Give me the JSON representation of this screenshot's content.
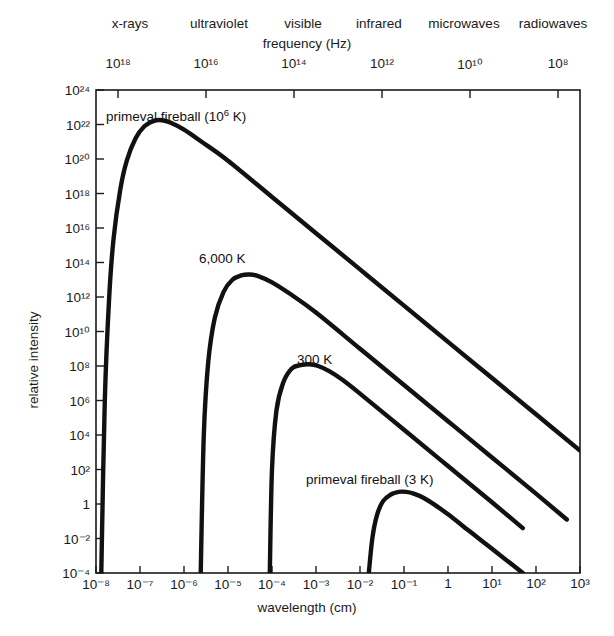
{
  "figure": {
    "frequency_axis_title": "frequency (Hz)",
    "wavelength_axis_title": "wavelength (cm)",
    "intensity_axis_title": "relative intensity"
  },
  "spectrum_bands": [
    {
      "label": "x-rays",
      "x": 130
    },
    {
      "label": "ultraviolet",
      "x": 219
    },
    {
      "label": "visible",
      "x": 303
    },
    {
      "label": "infrared",
      "x": 379
    },
    {
      "label": "microwaves",
      "x": 464
    },
    {
      "label": "radiowaves",
      "x": 553
    }
  ],
  "chart_data": {
    "type": "line",
    "title": "",
    "xlabel": "wavelength (cm)",
    "ylabel": "relative intensity",
    "top_xlabel": "frequency (Hz)",
    "x_scale": "log",
    "y_scale": "log",
    "xlim": [
      -8,
      3
    ],
    "ylim": [
      -4,
      24
    ],
    "grid": false,
    "legend": "inline-annotations",
    "x_ticks": [
      {
        "exp": "-8",
        "label": "10⁻⁸"
      },
      {
        "exp": "-7",
        "label": "10⁻⁷"
      },
      {
        "exp": "-6",
        "label": "10⁻⁶"
      },
      {
        "exp": "-5",
        "label": "10⁻⁵"
      },
      {
        "exp": "-4",
        "label": "10⁻⁴"
      },
      {
        "exp": "-3",
        "label": "10⁻³"
      },
      {
        "exp": "-2",
        "label": "10⁻²"
      },
      {
        "exp": "-1",
        "label": "10⁻¹"
      },
      {
        "exp": "0",
        "label": "1"
      },
      {
        "exp": "1",
        "label": "10¹"
      },
      {
        "exp": "2",
        "label": "10²"
      },
      {
        "exp": "3",
        "label": "10³"
      }
    ],
    "y_ticks": [
      {
        "exp": "24",
        "label": "10²⁴"
      },
      {
        "exp": "22",
        "label": "10²²"
      },
      {
        "exp": "20",
        "label": "10²⁰"
      },
      {
        "exp": "18",
        "label": "10¹⁸"
      },
      {
        "exp": "16",
        "label": "10¹⁶"
      },
      {
        "exp": "14",
        "label": "10¹⁴"
      },
      {
        "exp": "12",
        "label": "10¹²"
      },
      {
        "exp": "10",
        "label": "10¹⁰"
      },
      {
        "exp": "8",
        "label": "10⁸"
      },
      {
        "exp": "6",
        "label": "10⁶"
      },
      {
        "exp": "4",
        "label": "10⁴"
      },
      {
        "exp": "2",
        "label": "10²"
      },
      {
        "exp": "0",
        "label": "1"
      },
      {
        "exp": "-2",
        "label": "10⁻²"
      },
      {
        "exp": "-4",
        "label": "10⁻⁴"
      }
    ],
    "top_ticks": [
      {
        "label": "10¹⁸",
        "x_exp": -7.5
      },
      {
        "label": "10¹⁶",
        "x_exp": -5.5
      },
      {
        "label": "10¹⁴",
        "x_exp": -3.5
      },
      {
        "label": "10¹²",
        "x_exp": -1.5
      },
      {
        "label": "10¹⁰",
        "x_exp": 0.5
      },
      {
        "label": "10⁸",
        "x_exp": 2.5
      }
    ],
    "series": [
      {
        "name": "primeval fireball (10⁶ K)",
        "temperature_K": 1000000,
        "peak_x_exp": -5.55,
        "peak_y_exp": 22.2,
        "label_html": "primeval fireball (10<sup>6</sup> K)",
        "label_x": 106,
        "label_y": 109,
        "points": [
          [
            -7.88,
            -4.0
          ],
          [
            -7.8,
            6.0
          ],
          [
            -7.7,
            12.0
          ],
          [
            -7.6,
            15.4
          ],
          [
            -7.45,
            18.2
          ],
          [
            -7.3,
            19.9
          ],
          [
            -7.1,
            21.2
          ],
          [
            -6.9,
            21.9
          ],
          [
            -6.7,
            22.2
          ],
          [
            -6.5,
            22.25
          ],
          [
            -6.3,
            22.1
          ],
          [
            -6.0,
            21.7
          ],
          [
            -5.6,
            21.0
          ],
          [
            -5.0,
            19.9
          ],
          [
            -4.0,
            17.8
          ],
          [
            -3.0,
            15.7
          ],
          [
            -2.0,
            13.6
          ],
          [
            -1.0,
            11.5
          ],
          [
            0.0,
            9.4
          ],
          [
            1.0,
            7.3
          ],
          [
            2.0,
            5.2
          ],
          [
            3.0,
            3.1
          ]
        ]
      },
      {
        "name": "6,000 K",
        "temperature_K": 6000,
        "peak_x_exp": -3.5,
        "peak_y_exp": 13.2,
        "label_html": "6,000 K",
        "label_x": 199,
        "label_y": 251,
        "points": [
          [
            -5.62,
            -4.0
          ],
          [
            -5.55,
            4.0
          ],
          [
            -5.45,
            8.2
          ],
          [
            -5.3,
            10.8
          ],
          [
            -5.1,
            12.3
          ],
          [
            -4.9,
            13.0
          ],
          [
            -4.7,
            13.25
          ],
          [
            -4.5,
            13.3
          ],
          [
            -4.3,
            13.2
          ],
          [
            -4.0,
            12.85
          ],
          [
            -3.6,
            12.2
          ],
          [
            -3.0,
            11.1
          ],
          [
            -2.0,
            9.0
          ],
          [
            -1.0,
            6.9
          ],
          [
            0.0,
            4.8
          ],
          [
            1.0,
            2.7
          ],
          [
            2.0,
            0.6
          ],
          [
            2.7,
            -0.9
          ]
        ]
      },
      {
        "name": "300 K",
        "temperature_K": 300,
        "peak_x_exp": -2.25,
        "peak_y_exp": 8.0,
        "label_html": "300 K",
        "label_x": 297,
        "label_y": 352,
        "points": [
          [
            -4.05,
            -4.0
          ],
          [
            -4.0,
            2.0
          ],
          [
            -3.9,
            5.4
          ],
          [
            -3.75,
            7.0
          ],
          [
            -3.55,
            7.85
          ],
          [
            -3.35,
            8.05
          ],
          [
            -3.15,
            8.1
          ],
          [
            -2.95,
            8.0
          ],
          [
            -2.7,
            7.7
          ],
          [
            -2.4,
            7.2
          ],
          [
            -2.0,
            6.4
          ],
          [
            -1.0,
            4.3
          ],
          [
            0.0,
            2.2
          ],
          [
            1.0,
            0.1
          ],
          [
            1.7,
            -1.4
          ]
        ]
      },
      {
        "name": "primeval fireball (3 K)",
        "temperature_K": 3,
        "peak_x_exp": -0.9,
        "peak_y_exp": 0.6,
        "label_html": "primeval fireball (3 K)",
        "label_x": 306,
        "label_y": 472,
        "points": [
          [
            -1.8,
            -4.0
          ],
          [
            -1.72,
            -2.0
          ],
          [
            -1.62,
            -0.7
          ],
          [
            -1.48,
            0.15
          ],
          [
            -1.3,
            0.55
          ],
          [
            -1.12,
            0.7
          ],
          [
            -0.95,
            0.7
          ],
          [
            -0.78,
            0.6
          ],
          [
            -0.55,
            0.35
          ],
          [
            -0.3,
            -0.05
          ],
          [
            0.0,
            -0.6
          ],
          [
            0.5,
            -1.6
          ],
          [
            1.0,
            -2.6
          ],
          [
            1.5,
            -3.6
          ],
          [
            1.7,
            -4.0
          ]
        ]
      }
    ]
  }
}
